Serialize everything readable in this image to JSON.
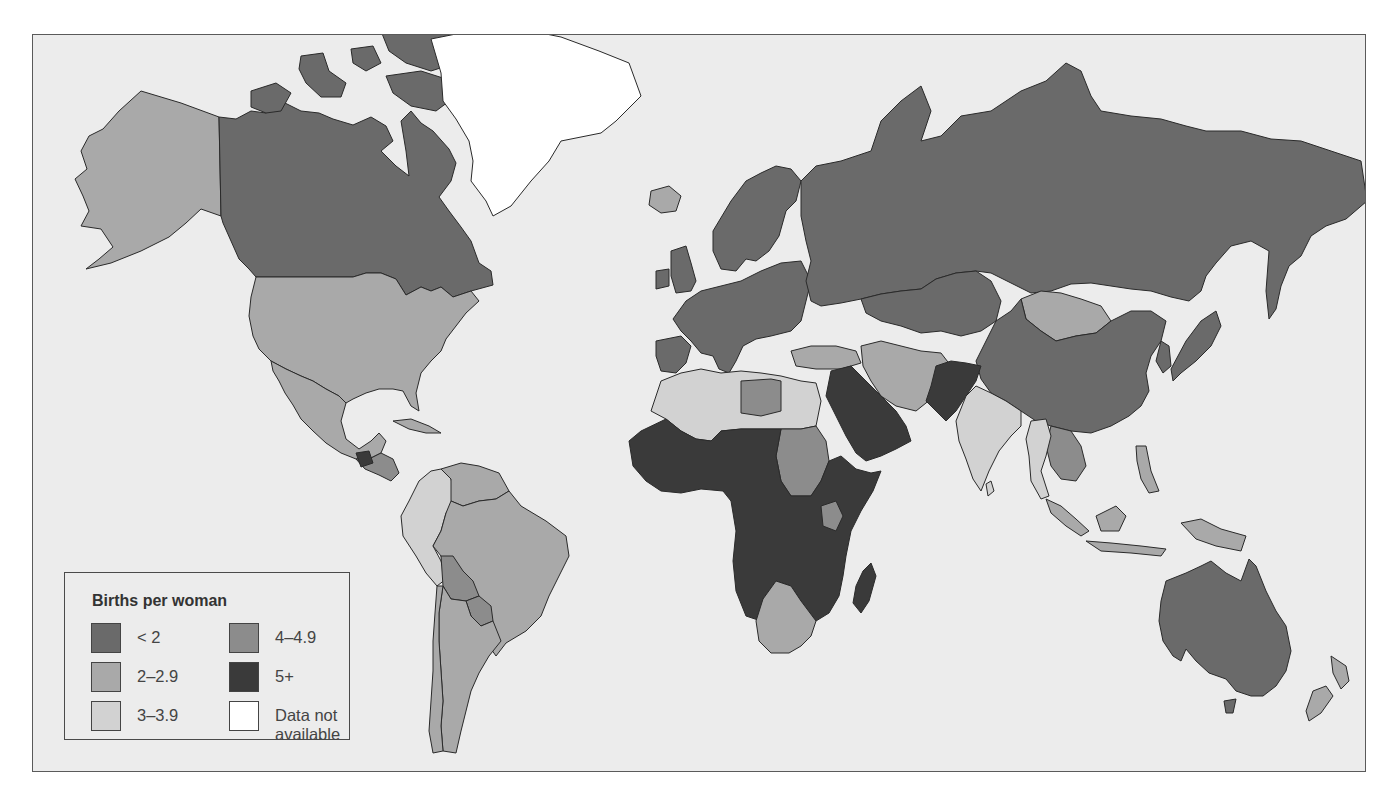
{
  "legend": {
    "title": "Births per woman",
    "items": [
      {
        "label": "< 2",
        "color": "#6a6a6a"
      },
      {
        "label": "2–2.9",
        "color": "#a9a9a9"
      },
      {
        "label": "3–3.9",
        "color": "#d2d2d2"
      },
      {
        "label": "4–4.9",
        "color": "#8c8c8c"
      },
      {
        "label": "5+",
        "color": "#3a3a3a"
      },
      {
        "label": "Data not available",
        "line1": "Data not",
        "line2": "available",
        "color": "#ffffff"
      }
    ]
  },
  "colors": {
    "ocean": "#ececec",
    "page": "#ffffff",
    "border": "#2a2a2a"
  },
  "regions": [
    {
      "name": "alaska",
      "category": "2-2.9",
      "fill": "#a9a9a9",
      "d": "M140 90 L180 102 L218 116 L220 215 L200 208 L185 222 L168 236 L140 250 L110 262 L85 268 L98 258 L112 246 L100 228 L80 225 L88 210 L82 195 L74 178 L86 168 L80 150 L88 135 L102 128 L118 110 Z"
    },
    {
      "name": "canada",
      "category": "<2",
      "fill": "#6a6a6a",
      "d": "M218 116 L235 118 L250 110 L265 112 L280 100 L300 110 L318 112 L332 118 L352 124 L370 116 L385 125 L392 140 L380 150 L395 165 L408 175 L405 150 L400 120 L410 110 L420 122 L432 130 L448 148 L455 162 L450 180 L438 196 L448 210 L460 226 L470 240 L478 262 L490 270 L492 284 L470 290 L452 296 L440 286 L430 290 L420 286 L405 294 L395 278 L380 272 L365 272 L352 276 L325 276 L255 276 L248 268 L238 258 L230 240 L222 222 L220 215 Z"
    },
    {
      "name": "canada-arctic-islands",
      "category": "<2",
      "fill": "#6a6a6a",
      "d": "M250 90 L275 82 L290 92 L280 110 L265 112 L250 106 Z M300 55 L322 52 L328 70 L345 82 L340 96 L320 96 L305 82 L298 68 Z M350 48 L372 45 L380 62 L365 70 L352 62 Z M380 30 L420 22 L450 30 L468 45 L455 62 L430 70 L405 62 L388 50 Z M385 75 L420 70 L445 78 L455 95 L435 110 L410 105 L392 92 Z"
    },
    {
      "name": "greenland",
      "category": "n/a",
      "fill": "#ffffff",
      "d": "M430 38 L470 30 L520 28 L560 36 L598 50 L628 62 L640 95 L615 120 L600 132 L560 140 L548 160 L530 180 L510 205 L492 215 L485 200 L470 180 L472 160 L468 140 L455 118 L442 100 L440 72 L435 55 Z"
    },
    {
      "name": "usa",
      "category": "2-2.9",
      "fill": "#a9a9a9",
      "d": "M255 276 L325 276 L352 276 L365 272 L380 272 L395 278 L405 294 L420 286 L430 290 L440 286 L452 296 L470 290 L478 300 L465 312 L455 325 L445 338 L440 350 L430 360 L420 372 L415 392 L418 410 L410 405 L402 390 L392 388 L378 388 L365 392 L352 398 L345 402 L338 395 L325 388 L312 380 L300 375 L285 368 L270 360 L258 348 L252 335 L248 315 L250 296 Z"
    },
    {
      "name": "mexico",
      "category": "2-2.9",
      "fill": "#a9a9a9",
      "d": "M270 360 L285 368 L300 375 L312 380 L325 388 L338 395 L345 402 L340 420 L345 438 L358 448 L370 440 L378 432 L385 440 L380 452 L368 458 L355 458 L340 452 L325 442 L312 430 L300 418 L292 404 L284 392 L278 380 L272 370 Z"
    },
    {
      "name": "central-america",
      "category": "4-4.9",
      "fill": "#8c8c8c",
      "d": "M355 458 L368 458 L380 452 L392 458 L398 472 L390 480 L378 474 L364 468 Z"
    },
    {
      "name": "guatemala",
      "category": "5+",
      "fill": "#3a3a3a",
      "d": "M355 452 L368 450 L372 462 L360 466 Z"
    },
    {
      "name": "cuba",
      "category": "2-2.9",
      "fill": "#a9a9a9",
      "d": "M392 420 L410 418 L428 425 L440 432 L425 432 L408 428 Z"
    },
    {
      "name": "colombia-peru-ecuador",
      "category": "3-3.9",
      "fill": "#d2d2d2",
      "d": "M418 480 L430 470 L440 468 L450 478 L455 500 L445 512 L440 530 L432 545 L440 560 L445 578 L436 585 L425 572 L415 555 L402 535 L400 515 L408 500 Z"
    },
    {
      "name": "venezuela-guianas",
      "category": "2-2.9",
      "fill": "#a9a9a9",
      "d": "M440 468 L460 462 L478 465 L498 472 L508 490 L495 498 L478 500 L462 505 L450 500 L450 478 Z"
    },
    {
      "name": "brazil",
      "category": "2-2.9",
      "fill": "#a9a9a9",
      "d": "M450 500 L462 505 L478 500 L495 498 L508 490 L520 505 L545 520 L565 535 L568 555 L558 575 L548 595 L540 615 L525 630 L505 642 L495 655 L488 645 L478 625 L470 610 L460 598 L450 585 L445 570 L440 555 L432 545 L440 530 L445 512 Z"
    },
    {
      "name": "bolivia",
      "category": "4-4.9",
      "fill": "#8c8c8c",
      "d": "M440 555 L452 555 L462 570 L472 580 L478 595 L465 600 L450 598 L442 585 Z"
    },
    {
      "name": "paraguay",
      "category": "4-4.9",
      "fill": "#8c8c8c",
      "d": "M465 600 L478 595 L490 605 L492 620 L480 625 L470 615 Z"
    },
    {
      "name": "argentina",
      "category": "2-2.9",
      "fill": "#a9a9a9",
      "d": "M442 585 L450 598 L465 600 L470 615 L480 625 L492 620 L500 640 L488 655 L478 672 L470 690 L465 710 L460 730 L455 752 L442 750 L440 725 L442 700 L440 670 L438 640 L438 612 Z"
    },
    {
      "name": "chile",
      "category": "2-2.9",
      "fill": "#a9a9a9",
      "d": "M436 585 L442 585 L438 612 L438 640 L440 670 L442 700 L440 725 L442 750 L432 752 L428 730 L430 700 L432 670 L432 640 L434 612 Z"
    },
    {
      "name": "iceland",
      "category": "2-2.9",
      "fill": "#a9a9a9",
      "d": "M650 190 L668 185 L680 195 L675 210 L660 212 L648 204 Z"
    },
    {
      "name": "uk-ireland",
      "category": "<2",
      "fill": "#6a6a6a",
      "d": "M670 250 L685 245 L690 262 L695 280 L690 290 L675 292 L670 275 Z M655 270 L668 268 L668 285 L655 288 Z"
    },
    {
      "name": "scandinavia",
      "category": "<2",
      "fill": "#6a6a6a",
      "d": "M712 230 L730 200 L745 180 L760 172 L775 165 L790 168 L800 180 L795 200 L785 210 L778 235 L768 250 L755 260 L745 258 L735 270 L720 268 L712 250 Z"
    },
    {
      "name": "europe-mainland",
      "category": "<2",
      "fill": "#6a6a6a",
      "d": "M685 300 L700 290 L720 285 L740 280 L760 270 L780 262 L800 260 L810 280 L805 300 L800 320 L790 330 L770 335 L755 338 L742 345 L735 360 L728 372 L718 368 L712 355 L700 352 L690 340 L680 330 L672 318 Z"
    },
    {
      "name": "iberia",
      "category": "<2",
      "fill": "#6a6a6a",
      "d": "M655 340 L680 335 L690 345 L685 362 L675 372 L660 370 L655 355 Z"
    },
    {
      "name": "russia",
      "category": "<2",
      "fill": "#6a6a6a",
      "d": "M800 180 L815 165 L840 160 L870 150 L880 120 L900 100 L920 85 L930 110 L920 140 L940 135 L960 115 L990 110 L1020 90 L1045 80 L1065 62 L1080 70 L1090 95 L1100 110 L1130 115 L1160 118 L1185 125 L1205 130 L1240 130 L1270 138 L1300 140 L1330 150 L1360 160 L1366 200 L1345 218 L1325 225 L1310 235 L1300 255 L1288 265 L1280 285 L1275 308 L1268 318 L1265 290 L1268 250 L1250 240 L1230 245 L1215 262 L1205 275 L1200 290 L1188 300 L1170 296 L1150 290 L1130 288 L1110 285 L1090 282 L1070 283 L1050 290 L1030 292 L1010 282 L990 272 L975 270 L955 272 L935 278 L920 288 L900 290 L880 293 L860 298 L840 302 L820 305 L810 300 L805 280 L810 260 L805 240 L800 215 Z"
    },
    {
      "name": "kazakhstan-central-asia",
      "category": "<2",
      "fill": "#6a6a6a",
      "d": "M860 298 L880 293 L900 290 L920 288 L935 278 L955 272 L975 270 L990 280 L1000 300 L995 320 L980 330 L960 335 L940 330 L920 332 L900 325 L880 320 L865 312 Z"
    },
    {
      "name": "mongolia",
      "category": "2-2.9",
      "fill": "#a9a9a9",
      "d": "M1020 298 L1040 290 L1060 292 L1080 298 L1100 305 L1110 320 L1095 332 L1075 335 L1055 340 L1040 330 L1025 318 Z"
    },
    {
      "name": "china",
      "category": "<2",
      "fill": "#6a6a6a",
      "d": "M995 320 L1010 310 L1020 298 L1025 318 L1040 330 L1055 340 L1075 335 L1095 332 L1110 320 L1130 310 L1150 310 L1165 320 L1160 340 L1150 355 L1145 372 L1148 390 L1140 405 L1128 415 L1110 425 L1090 432 L1070 430 L1050 425 L1035 420 L1020 410 L1005 400 L990 392 L980 378 L975 360 L985 340 Z"
    },
    {
      "name": "korea-japan",
      "category": "<2",
      "fill": "#6a6a6a",
      "d": "M1160 340 L1168 345 L1170 365 L1162 372 L1155 360 Z M1185 340 L1200 320 L1215 310 L1220 325 L1210 345 L1195 360 L1180 372 L1172 380 L1170 368 Z"
    },
    {
      "name": "turkey-caucasus",
      "category": "2-2.9",
      "fill": "#a9a9a9",
      "d": "M790 350 L810 345 L835 345 L855 350 L860 362 L840 368 L815 368 L795 365 Z"
    },
    {
      "name": "iran-central",
      "category": "2-2.9",
      "fill": "#a9a9a9",
      "d": "M860 345 L880 340 L900 345 L920 350 L940 352 L950 365 L940 380 L930 398 L915 410 L895 405 L880 395 L870 380 L862 365 Z"
    },
    {
      "name": "afghanistan-pakistan",
      "category": "5+",
      "fill": "#3a3a3a",
      "d": "M935 365 L950 360 L965 362 L980 365 L975 380 L965 395 L955 410 L945 420 L935 410 L925 400 L930 385 Z"
    },
    {
      "name": "india",
      "category": "3-3.9",
      "fill": "#d2d2d2",
      "d": "M965 395 L975 385 L990 392 L1005 400 L1020 410 L1020 425 L1010 435 L998 450 L988 470 L980 490 L972 478 L965 458 L958 440 L955 420 Z"
    },
    {
      "name": "sri-lanka",
      "category": "3-3.9",
      "fill": "#d2d2d2",
      "d": "M985 483 L990 480 L993 490 L987 495 Z"
    },
    {
      "name": "saudi-arabia-yemen",
      "category": "5+",
      "fill": "#3a3a3a",
      "d": "M830 370 L850 365 L865 380 L880 395 L895 410 L905 425 L910 440 L895 448 L880 455 L865 460 L855 452 L845 435 L835 415 L825 395 Z"
    },
    {
      "name": "north-africa-algeria-libya-egypt",
      "category": "3-3.9",
      "fill": "#d2d2d2",
      "d": "M660 380 L680 372 L700 368 L720 372 L740 370 L760 372 L780 375 L800 380 L815 382 L820 400 L815 425 L800 428 L780 428 L760 428 L740 428 L720 430 L710 440 L695 438 L680 430 L665 418 L650 410 L655 395 Z"
    },
    {
      "name": "libya",
      "category": "4-4.9",
      "fill": "#8c8c8c",
      "d": "M740 380 L770 378 L780 380 L780 410 L760 415 L740 412 Z"
    },
    {
      "name": "sudan",
      "category": "4-4.9",
      "fill": "#8c8c8c",
      "d": "M780 428 L800 428 L815 425 L825 440 L828 460 L820 480 L810 495 L790 495 L780 480 L775 455 Z"
    },
    {
      "name": "sub-saharan-africa",
      "category": "5+",
      "fill": "#3a3a3a",
      "d": "M628 440 L640 430 L665 418 L680 430 L695 438 L710 440 L720 430 L740 428 L760 428 L780 428 L775 455 L780 480 L790 495 L810 495 L820 480 L828 460 L840 455 L855 468 L870 472 L880 470 L872 490 L860 510 L850 530 L845 555 L842 575 L838 595 L828 612 L815 620 L800 600 L790 585 L775 580 L762 598 L760 620 L745 615 L735 590 L732 560 L735 530 L730 500 L722 490 L700 488 L680 492 L660 490 L645 480 L632 465 Z"
    },
    {
      "name": "kenya",
      "category": "4-4.9",
      "fill": "#8c8c8c",
      "d": "M820 505 L835 500 L842 515 L835 530 L822 525 Z"
    },
    {
      "name": "southern-africa",
      "category": "2-2.9",
      "fill": "#a9a9a9",
      "d": "M762 598 L775 580 L790 585 L800 600 L815 620 L810 635 L800 645 L788 652 L770 652 L758 640 L755 620 Z"
    },
    {
      "name": "madagascar",
      "category": "5+",
      "fill": "#3a3a3a",
      "d": "M862 570 L870 562 L875 575 L868 600 L860 612 L852 602 L855 585 Z"
    },
    {
      "name": "southeast-asia-indochina",
      "category": "4-4.9",
      "fill": "#8c8c8c",
      "d": "M1050 425 L1070 430 L1080 445 L1085 465 L1075 480 L1060 478 L1050 465 L1045 445 Z"
    },
    {
      "name": "burma-thailand",
      "category": "3-3.9",
      "fill": "#d2d2d2",
      "d": "M1030 420 L1045 418 L1050 435 L1045 455 L1040 470 L1048 495 L1040 498 L1030 480 L1028 455 L1025 438 Z"
    },
    {
      "name": "indonesia",
      "category": "2-2.9",
      "fill": "#a9a9a9",
      "d": "M1045 498 L1060 505 L1075 518 L1088 530 L1080 535 L1065 525 L1050 512 Z M1095 515 L1115 505 L1125 515 L1118 530 L1100 530 Z M1085 540 L1110 542 L1140 545 L1165 548 L1160 555 L1130 552 L1100 550 Z M1180 522 L1200 518 L1220 528 L1245 535 L1240 550 L1215 545 L1195 538 Z"
    },
    {
      "name": "philippines",
      "category": "2-2.9",
      "fill": "#a9a9a9",
      "d": "M1135 445 L1145 445 L1150 470 L1158 490 L1148 492 L1140 478 L1136 460 Z"
    },
    {
      "name": "australia",
      "category": "<2",
      "fill": "#6a6a6a",
      "d": "M1165 580 L1185 572 L1200 565 L1210 560 L1225 572 L1240 580 L1248 558 L1255 565 L1265 590 L1275 610 L1285 625 L1290 650 L1285 670 L1275 685 L1262 695 L1250 695 L1235 690 L1225 678 L1208 672 L1195 660 L1185 648 L1180 660 L1172 655 L1162 640 L1158 620 L1160 600 Z"
    },
    {
      "name": "tasmania",
      "category": "<2",
      "fill": "#6a6a6a",
      "d": "M1223 700 L1235 698 L1232 712 L1225 712 Z"
    },
    {
      "name": "new-zealand",
      "category": "2-2.9",
      "fill": "#a9a9a9",
      "d": "M1330 655 L1345 665 L1348 680 L1340 688 L1332 672 Z M1312 690 L1325 685 L1332 695 L1320 712 L1308 720 L1305 710 Z"
    }
  ]
}
